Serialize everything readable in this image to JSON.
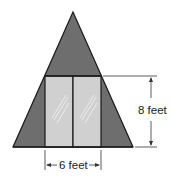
{
  "diagram": {
    "shapes": {
      "triangle": {
        "name": "a-frame-triangle",
        "fill": "#6e6e6e",
        "stroke": "#1a1a1a"
      },
      "door": {
        "name": "glass-door",
        "panels": 2,
        "fill": "#d0d0d0",
        "stroke": "#1a1a1a"
      }
    },
    "dimensions": {
      "height_label": "8 feet",
      "width_label": "6 feet"
    },
    "colors": {
      "roof_gray": "#6e6e6e",
      "glass_gray": "#d0d0d0",
      "outline": "#1a1a1a",
      "glare": "#ececec"
    }
  }
}
